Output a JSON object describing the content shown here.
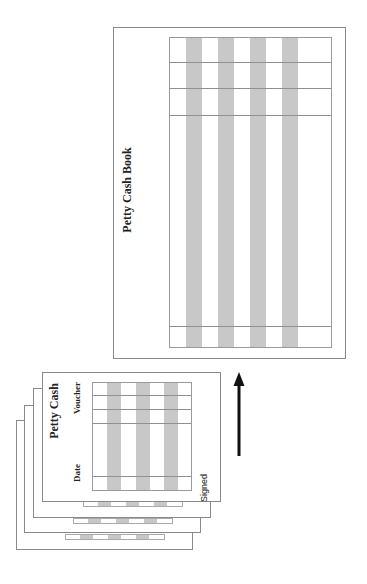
{
  "book": {
    "title": "Petty Cash Book",
    "band_count": 4,
    "colors": {
      "band": "#c8c8c8",
      "border": "#8a8a8a"
    }
  },
  "voucher": {
    "title": "Petty Cash",
    "label_voucher": "Voucher",
    "label_date": "Date",
    "label_signed": "Signed",
    "stack_count": 4
  },
  "arrow": {
    "direction": "up",
    "meaning": "vouchers posted to petty cash book"
  }
}
